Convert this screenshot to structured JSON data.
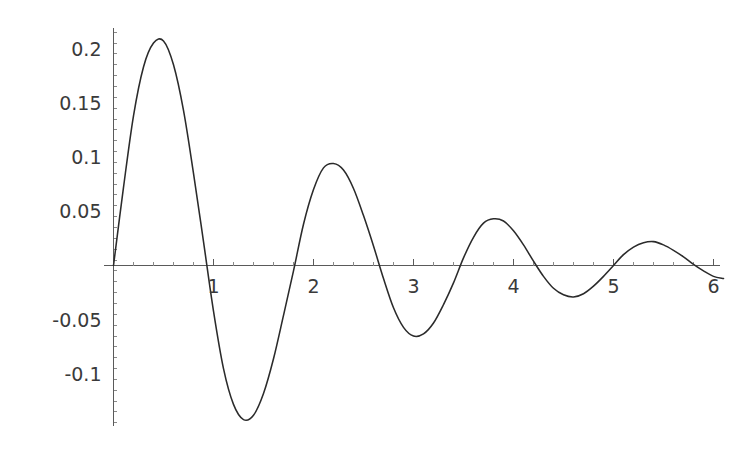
{
  "figure": {
    "title": "",
    "background_color": "#ffffff",
    "curve_color": "#2b2b2b",
    "axis_color": "#5a5a5a",
    "label_color": "#3a3a3a"
  },
  "chart_data": {
    "type": "line",
    "title": "",
    "subtitle": "",
    "xlabel": "",
    "ylabel": "",
    "xlim": [
      0,
      6.1
    ],
    "ylim": [
      -0.155,
      0.215
    ],
    "grid": false,
    "legend": null,
    "axis_style": "cross-hair axes through origin, Mathematica default",
    "x_ticks_major": [
      1,
      2,
      3,
      4,
      5,
      6
    ],
    "x_tick_labels": [
      "1",
      "2",
      "3",
      "4",
      "5",
      "6"
    ],
    "x_minor_ticks_per_interval": 4,
    "y_ticks_major": [
      -0.1,
      -0.05,
      0.05,
      0.1,
      0.15,
      0.2
    ],
    "y_tick_labels": [
      "-0.1",
      "-0.05",
      "0.05",
      "0.1",
      "0.15",
      "0.2"
    ],
    "y_minor_ticks_per_interval": 4,
    "series": [
      {
        "name": "damped oscillation",
        "description": "decaying sinusoid, amplitude envelope ~0.26*exp(-0.42x)",
        "x": [
          0.0,
          0.1,
          0.2,
          0.3,
          0.4,
          0.5,
          0.6,
          0.7,
          0.8,
          0.9,
          1.0,
          1.1,
          1.2,
          1.3,
          1.4,
          1.5,
          1.6,
          1.7,
          1.8,
          1.9,
          2.0,
          2.1,
          2.2,
          2.3,
          2.4,
          2.5,
          2.6,
          2.7,
          2.8,
          2.9,
          3.0,
          3.1,
          3.2,
          3.3,
          3.4,
          3.5,
          3.6,
          3.7,
          3.8,
          3.9,
          4.0,
          4.1,
          4.2,
          4.3,
          4.4,
          4.5,
          4.6,
          4.7,
          4.8,
          4.9,
          5.0,
          5.1,
          5.2,
          5.3,
          5.4,
          5.5,
          5.6,
          5.7,
          5.8,
          5.9,
          6.0,
          6.1
        ],
        "y": [
          0.0,
          0.072,
          0.138,
          0.183,
          0.205,
          0.207,
          0.185,
          0.143,
          0.085,
          0.022,
          -0.042,
          -0.095,
          -0.128,
          -0.142,
          -0.138,
          -0.118,
          -0.086,
          -0.046,
          -0.005,
          0.038,
          0.07,
          0.09,
          0.094,
          0.088,
          0.071,
          0.046,
          0.018,
          -0.012,
          -0.039,
          -0.057,
          -0.065,
          -0.063,
          -0.053,
          -0.036,
          -0.016,
          0.007,
          0.026,
          0.039,
          0.043,
          0.041,
          0.032,
          0.019,
          0.004,
          -0.01,
          -0.021,
          -0.027,
          -0.029,
          -0.026,
          -0.019,
          -0.01,
          0.0,
          0.01,
          0.017,
          0.021,
          0.022,
          0.019,
          0.014,
          0.008,
          0.001,
          -0.005,
          -0.01,
          -0.012
        ],
        "key_points": {
          "peak_1": {
            "x": 0.52,
            "y": 0.207
          },
          "trough_1": {
            "x": 1.3,
            "y": -0.142
          },
          "peak_2": {
            "x": 2.15,
            "y": 0.094
          },
          "trough_2": {
            "x": 2.98,
            "y": -0.065
          },
          "peak_3": {
            "x": 3.8,
            "y": 0.043
          },
          "trough_3": {
            "x": 4.62,
            "y": -0.029
          },
          "peak_4": {
            "x": 5.42,
            "y": 0.022
          },
          "zero_crossings": [
            0.0,
            0.92,
            1.77,
            2.62,
            3.42,
            4.25,
            5.02,
            5.85
          ]
        }
      }
    ]
  },
  "axes": {
    "x_axis_name": "horizontal-axis",
    "y_axis_name": "vertical-axis"
  }
}
